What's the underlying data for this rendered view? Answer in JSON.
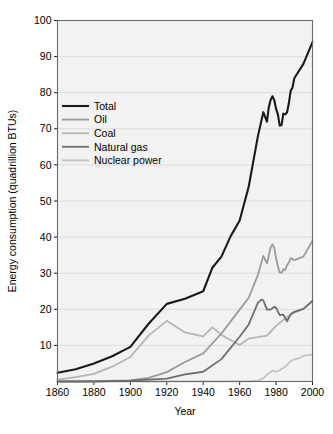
{
  "chart_data": {
    "type": "line",
    "title": "",
    "xlabel": "Year",
    "ylabel": "Energy consumption (quadrillion BTUs)",
    "xlim": [
      1860,
      2000
    ],
    "ylim": [
      0,
      100
    ],
    "xticks": [
      1860,
      1880,
      1900,
      1920,
      1940,
      1960,
      1980,
      2000
    ],
    "yticks": [
      10,
      20,
      30,
      40,
      50,
      60,
      70,
      80,
      90,
      100
    ],
    "grid": "horizontal",
    "legend_position": "upper-left-inside",
    "plot_background": "#f2f2f2",
    "series": [
      {
        "name": "Total",
        "color": "#1a1a1a",
        "width": 2.1,
        "x": [
          1860,
          1870,
          1880,
          1890,
          1900,
          1910,
          1920,
          1930,
          1940,
          1945,
          1950,
          1955,
          1960,
          1965,
          1970,
          1973,
          1975,
          1976,
          1977,
          1978,
          1979,
          1980,
          1981,
          1982,
          1983,
          1984,
          1985,
          1986,
          1987,
          1988,
          1989,
          1990,
          1995,
          2000
        ],
        "y": [
          2.4,
          3.4,
          5.0,
          7.0,
          9.6,
          16.0,
          21.5,
          22.9,
          25.0,
          31.5,
          34.6,
          40.2,
          44.6,
          54.0,
          67.9,
          74.6,
          72.0,
          76.0,
          78.0,
          79.0,
          78.0,
          75.5,
          74.0,
          70.9,
          71.0,
          74.2,
          74.0,
          74.5,
          77.0,
          80.5,
          81.4,
          84.0,
          88.0,
          94.0
        ]
      },
      {
        "name": "Oil",
        "color": "#9a9a9a",
        "width": 1.8,
        "x": [
          1860,
          1880,
          1900,
          1910,
          1920,
          1930,
          1940,
          1950,
          1960,
          1965,
          1970,
          1973,
          1975,
          1977,
          1978,
          1979,
          1980,
          1981,
          1982,
          1983,
          1984,
          1985,
          1986,
          1987,
          1988,
          1990,
          1995,
          2000
        ],
        "y": [
          0.0,
          0.1,
          0.3,
          1.0,
          2.6,
          5.4,
          7.8,
          13.3,
          19.9,
          23.2,
          29.5,
          34.8,
          32.7,
          37.1,
          38.0,
          37.1,
          34.2,
          31.9,
          30.2,
          30.1,
          31.1,
          30.9,
          32.2,
          32.9,
          34.2,
          33.6,
          34.6,
          39.0
        ]
      },
      {
        "name": "Coal",
        "color": "#b5b5b5",
        "width": 1.8,
        "x": [
          1860,
          1870,
          1880,
          1890,
          1900,
          1910,
          1920,
          1930,
          1940,
          1945,
          1950,
          1955,
          1960,
          1965,
          1970,
          1975,
          1980,
          1985,
          1990,
          1995,
          2000
        ],
        "y": [
          0.5,
          1.2,
          2.1,
          4.1,
          6.8,
          12.7,
          16.8,
          13.6,
          12.5,
          15.0,
          12.9,
          11.5,
          10.1,
          11.9,
          12.3,
          12.7,
          15.4,
          17.5,
          19.1,
          20.1,
          22.4
        ]
      },
      {
        "name": "Natural gas",
        "color": "#6e6e6e",
        "width": 1.8,
        "x": [
          1860,
          1880,
          1900,
          1910,
          1920,
          1930,
          1940,
          1950,
          1960,
          1965,
          1970,
          1972,
          1973,
          1975,
          1977,
          1979,
          1980,
          1982,
          1984,
          1986,
          1988,
          1990,
          1995,
          2000
        ],
        "y": [
          0.0,
          0.0,
          0.25,
          0.5,
          0.8,
          2.0,
          2.7,
          6.2,
          12.4,
          15.8,
          21.8,
          22.7,
          22.5,
          19.9,
          19.9,
          20.7,
          20.4,
          18.4,
          18.5,
          16.7,
          18.6,
          19.3,
          20.1,
          22.3
        ]
      },
      {
        "name": "Nuclear power",
        "color": "#c2c2c2",
        "width": 1.8,
        "x": [
          1860,
          1965,
          1970,
          1973,
          1975,
          1978,
          1980,
          1982,
          1985,
          1988,
          1990,
          1993,
          1995,
          2000
        ],
        "y": [
          0.0,
          0.04,
          0.24,
          0.91,
          1.9,
          3.0,
          2.7,
          3.1,
          4.1,
          5.6,
          6.1,
          6.5,
          7.1,
          7.5
        ]
      }
    ]
  },
  "axis": {
    "y_title": "Energy consumption (quadrillion BTUs)",
    "x_title": "Year",
    "y_tick_labels": [
      "10",
      "20",
      "30",
      "40",
      "50",
      "60",
      "70",
      "80",
      "90",
      "100"
    ],
    "x_tick_labels": [
      "1860",
      "1880",
      "1900",
      "1920",
      "1940",
      "1960",
      "1980",
      "2000"
    ]
  },
  "legend": {
    "entries": [
      {
        "label": "Total",
        "color": "#1a1a1a"
      },
      {
        "label": "Oil",
        "color": "#9a9a9a"
      },
      {
        "label": "Coal",
        "color": "#b5b5b5"
      },
      {
        "label": "Natural gas",
        "color": "#6e6e6e"
      },
      {
        "label": "Nuclear power",
        "color": "#c2c2c2"
      }
    ]
  }
}
